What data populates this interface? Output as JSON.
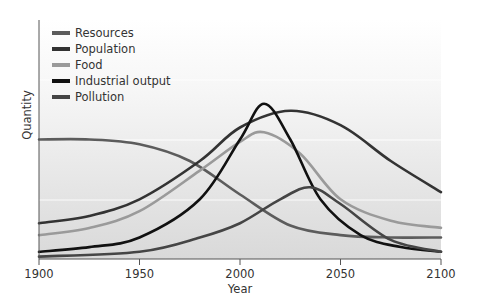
{
  "chart_data": {
    "type": "line",
    "title": "",
    "xlabel": "Year",
    "ylabel": "Quantity",
    "xlim": [
      1900,
      2100
    ],
    "ylim": [
      0,
      100
    ],
    "x_ticks": [
      1900,
      1950,
      2000,
      2050,
      2100
    ],
    "y_ticks": [],
    "grid": false,
    "legend_position": "upper-left",
    "series": [
      {
        "name": "Resources",
        "color": "#5c5c5c",
        "points": [
          [
            1900,
            50
          ],
          [
            1925,
            50
          ],
          [
            1950,
            48
          ],
          [
            1975,
            41
          ],
          [
            2000,
            27
          ],
          [
            2025,
            14
          ],
          [
            2050,
            10
          ],
          [
            2075,
            9
          ],
          [
            2100,
            9
          ]
        ]
      },
      {
        "name": "Population",
        "color": "#333333",
        "points": [
          [
            1900,
            15
          ],
          [
            1925,
            18
          ],
          [
            1950,
            25
          ],
          [
            1980,
            41
          ],
          [
            2000,
            55
          ],
          [
            2025,
            62
          ],
          [
            2050,
            56
          ],
          [
            2075,
            41
          ],
          [
            2100,
            28
          ]
        ]
      },
      {
        "name": "Food",
        "color": "#9a9a9a",
        "points": [
          [
            1900,
            10
          ],
          [
            1925,
            13
          ],
          [
            1950,
            20
          ],
          [
            1980,
            37
          ],
          [
            2000,
            49
          ],
          [
            2012,
            53
          ],
          [
            2030,
            44
          ],
          [
            2050,
            25
          ],
          [
            2075,
            16
          ],
          [
            2100,
            13
          ]
        ]
      },
      {
        "name": "Industrial output",
        "color": "#111111",
        "points": [
          [
            1900,
            3
          ],
          [
            1925,
            5
          ],
          [
            1950,
            9
          ],
          [
            1980,
            25
          ],
          [
            2000,
            50
          ],
          [
            2012,
            65
          ],
          [
            2025,
            50
          ],
          [
            2040,
            25
          ],
          [
            2060,
            10
          ],
          [
            2080,
            5
          ],
          [
            2100,
            3
          ]
        ]
      },
      {
        "name": "Pollution",
        "color": "#454545",
        "points": [
          [
            1900,
            1
          ],
          [
            1950,
            3
          ],
          [
            1980,
            9
          ],
          [
            2000,
            15
          ],
          [
            2020,
            25
          ],
          [
            2035,
            30
          ],
          [
            2050,
            23
          ],
          [
            2075,
            8
          ],
          [
            2100,
            3
          ]
        ]
      }
    ]
  }
}
